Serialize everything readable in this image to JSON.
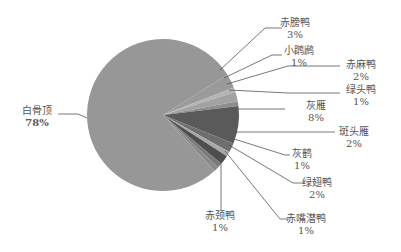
{
  "chart_data": {
    "type": "pie",
    "title": "",
    "slices": [
      {
        "label": "赤膀鸭",
        "pct_label": "3%",
        "value": 3,
        "color": "#9a9a9a"
      },
      {
        "label": "小䴙䴘",
        "pct_label": "1%",
        "value": 1,
        "color": "#b4b4b4"
      },
      {
        "label": "赤麻鸭",
        "pct_label": "2%",
        "value": 2,
        "color": "#a2a2a2"
      },
      {
        "label": "绿头鸭",
        "pct_label": "1%",
        "value": 1,
        "color": "#8e8e8e"
      },
      {
        "label": "灰雁",
        "pct_label": "8%",
        "value": 8,
        "color": "#5a5a5a"
      },
      {
        "label": "斑头雁",
        "pct_label": "2%",
        "value": 2,
        "color": "#6e6e6e"
      },
      {
        "label": "灰鹤",
        "pct_label": "1%",
        "value": 1,
        "color": "#a8a8a8"
      },
      {
        "label": "绿翅鸭",
        "pct_label": "2%",
        "value": 2,
        "color": "#4e4e4e"
      },
      {
        "label": "赤嘴潜鸭",
        "pct_label": "1%",
        "value": 1,
        "color": "#7a7a7a"
      },
      {
        "label": "赤颈鸭",
        "pct_label": "1%",
        "value": 1,
        "color": "#888888"
      },
      {
        "label": "白骨顶",
        "pct_label": "78%",
        "value": 78,
        "color": "#979797"
      }
    ],
    "legend": "none (leader-line labels)"
  },
  "labels": {
    "s0": {
      "name": "赤膀鸭",
      "pct": "3%"
    },
    "s1": {
      "name": "小䴙䴘",
      "pct": "1%"
    },
    "s2": {
      "name": "赤麻鸭",
      "pct": "2%"
    },
    "s3": {
      "name": "绿头鸭",
      "pct": "1%"
    },
    "s4": {
      "name": "灰雁",
      "pct": "8%"
    },
    "s5": {
      "name": "斑头雁",
      "pct": "2%"
    },
    "s6": {
      "name": "灰鹤",
      "pct": "1%"
    },
    "s7": {
      "name": "绿翅鸭",
      "pct": "2%"
    },
    "s8": {
      "name": "赤嘴潜鸭",
      "pct": "1%"
    },
    "s9": {
      "name": "赤颈鸭",
      "pct": "1%"
    },
    "s10": {
      "name": "白骨顶",
      "pct": "78%"
    }
  }
}
